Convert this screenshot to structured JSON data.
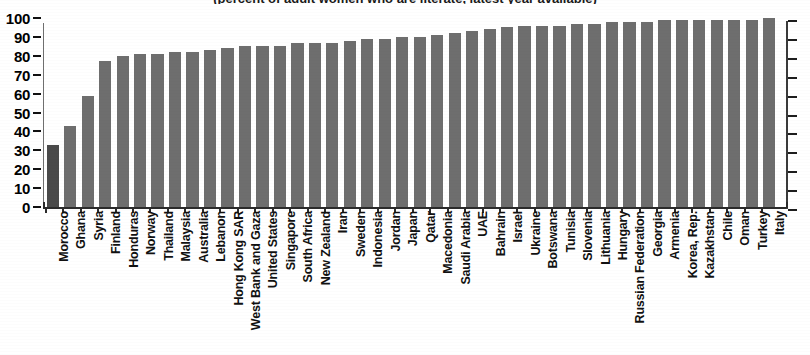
{
  "chart_data": {
    "type": "bar",
    "title": "(percent of adult women who are literate, latest year available)",
    "xlabel": "",
    "ylabel": "",
    "ylim": [
      0,
      100
    ],
    "yticks": [
      0,
      10,
      20,
      30,
      40,
      50,
      60,
      70,
      80,
      90,
      100
    ],
    "ytick_labels": [
      "0",
      "10",
      "20",
      "30",
      "40",
      "50",
      "60",
      "70",
      "80",
      "90",
      "100"
    ],
    "grid": false,
    "legend": "none",
    "highlight_index": 0,
    "bar_color": "#6e6e6e",
    "highlight_color": "#4a4a4a",
    "categories": [
      "Morocco",
      "Ghana",
      "Syria",
      "Finland",
      "Honduras",
      "Norway",
      "Thailand",
      "Malaysia",
      "Australia",
      "Lebanon",
      "Hong Kong SAR",
      "West Bank and Gaza",
      "United States",
      "Singapore",
      "South Africa",
      "New Zealand",
      "Iran",
      "Sweden",
      "Indonesia",
      "Jordan",
      "Japan",
      "Qatar",
      "Macedonia",
      "Saudi Arabia",
      "UAE",
      "Bahrain",
      "Israel",
      "Ukraine",
      "Botswana",
      "Tunisia",
      "Slovenia",
      "Lithuania",
      "Hungary",
      "Russian Federation",
      "Georgia",
      "Armenia",
      "Korea, Rep.",
      "Kazakhstan",
      "Chile",
      "Oman",
      "Turkey",
      "Italy"
    ],
    "values": [
      33,
      43,
      59,
      77,
      80,
      81,
      81,
      82,
      82,
      83,
      84,
      85,
      85,
      85,
      87,
      87,
      87,
      88,
      89,
      89,
      90,
      90,
      91,
      92,
      93,
      94,
      95,
      96,
      96,
      96,
      97,
      97,
      98,
      98,
      98,
      99,
      99,
      99,
      99,
      99,
      99,
      100
    ]
  },
  "axis": {
    "right_axis_visible": true,
    "baseline_visible": true
  }
}
